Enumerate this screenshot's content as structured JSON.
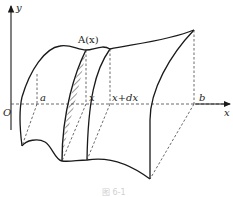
{
  "diagram": {
    "type": "solid-volume-by-cross-section",
    "axes": {
      "x_label": "x",
      "y_label": "y",
      "origin_label": "O"
    },
    "labels": {
      "cross_section": "A(x)",
      "a": "a",
      "x": "x",
      "x_plus_dx": "x+dx",
      "b": "b"
    },
    "caption": "图 6-1",
    "colors": {
      "stroke": "#1a1a1a",
      "dashed": "#444444",
      "background": "#ffffff"
    }
  }
}
